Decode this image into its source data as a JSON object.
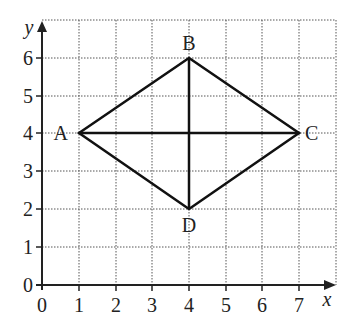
{
  "diagram": {
    "type": "coordinate-grid-rhombus",
    "axes": {
      "x_label": "x",
      "y_label": "y",
      "x_ticks": [
        "0",
        "1",
        "2",
        "3",
        "4",
        "5",
        "6",
        "7"
      ],
      "y_ticks": [
        "0",
        "1",
        "2",
        "3",
        "4",
        "5",
        "6"
      ]
    },
    "points": [
      {
        "name": "A",
        "x": 1,
        "y": 4
      },
      {
        "name": "B",
        "x": 4,
        "y": 6
      },
      {
        "name": "C",
        "x": 7,
        "y": 4
      },
      {
        "name": "D",
        "x": 4,
        "y": 2
      }
    ],
    "segments": [
      [
        "A",
        "B"
      ],
      [
        "B",
        "C"
      ],
      [
        "C",
        "D"
      ],
      [
        "D",
        "A"
      ],
      [
        "A",
        "C"
      ],
      [
        "B",
        "D"
      ]
    ],
    "grid": {
      "x_max": 8,
      "y_max": 7
    }
  },
  "labels": {
    "A": "A",
    "B": "B",
    "C": "C",
    "D": "D",
    "x": "x",
    "y": "y"
  }
}
